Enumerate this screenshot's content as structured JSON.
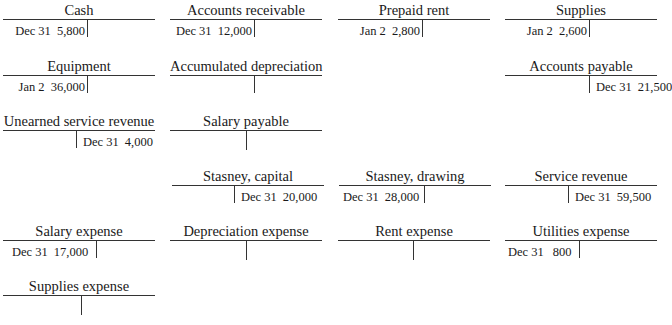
{
  "accounts": [
    {
      "name": "Cash",
      "debit": {
        "date": "Dec 31",
        "amount": "5,800"
      }
    },
    {
      "name": "Accounts receivable",
      "debit": {
        "date": "Dec 31",
        "amount": "12,000"
      }
    },
    {
      "name": "Prepaid rent",
      "debit": {
        "date": "Jan 2",
        "amount": "2,800"
      }
    },
    {
      "name": "Supplies",
      "debit": {
        "date": "Jan 2",
        "amount": "2,600"
      }
    },
    {
      "name": "Equipment",
      "debit": {
        "date": "Jan 2",
        "amount": "36,000"
      }
    },
    {
      "name": "Accumulated depreciation"
    },
    {
      "name": "Accounts payable",
      "credit": {
        "date": "Dec 31",
        "amount": "21,500"
      }
    },
    {
      "name": "Unearned service revenue",
      "credit": {
        "date": "Dec 31",
        "amount": "4,000"
      }
    },
    {
      "name": "Salary payable"
    },
    {
      "name": "Stasney, capital",
      "credit": {
        "date": "Dec 31",
        "amount": "20,000"
      }
    },
    {
      "name": "Stasney, drawing",
      "debit": {
        "date": "Dec 31",
        "amount": "28,000"
      }
    },
    {
      "name": "Service revenue",
      "credit": {
        "date": "Dec 31",
        "amount": "59,500"
      }
    },
    {
      "name": "Salary expense",
      "debit": {
        "date": "Dec 31",
        "amount": "17,000"
      }
    },
    {
      "name": "Depreciation expense"
    },
    {
      "name": "Rent expense"
    },
    {
      "name": "Utilities expense",
      "debit": {
        "date": "Dec 31",
        "amount": "800"
      }
    },
    {
      "name": "Supplies expense"
    }
  ]
}
